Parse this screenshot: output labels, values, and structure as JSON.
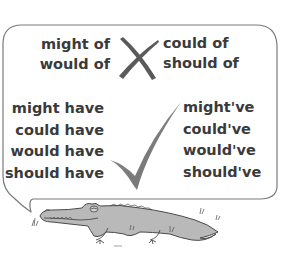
{
  "poster": {
    "incorrect": {
      "label": "incorrect forms",
      "icon": "cross-mark-icon",
      "left": [
        "might of",
        "would of"
      ],
      "right": [
        "could of",
        "should of"
      ]
    },
    "correct": {
      "label": "correct forms",
      "icon": "check-mark-icon",
      "left": [
        "might have",
        "could have",
        "would have",
        "should have"
      ],
      "right": [
        "might've",
        "could've",
        "would've",
        "should've"
      ]
    },
    "illustration": "crocodile"
  },
  "colors": {
    "text": "#3a3a3a",
    "mark": "#5a5a5a",
    "bubble_border": "#7a7a7a",
    "croc_fill": "#b9b9b9",
    "croc_outline": "#4a4a4a"
  }
}
